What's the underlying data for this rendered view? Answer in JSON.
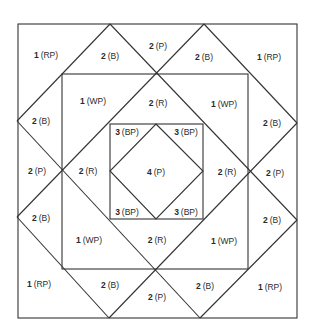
{
  "diagram": {
    "type": "quilt-block-piecing-diagram",
    "line_color": "#333333",
    "background": "#ffffff",
    "outer_square": {
      "x1": 18,
      "y1": 24,
      "x2": 297,
      "y2": 318
    },
    "middle_square": {
      "x1": 62,
      "y1": 74,
      "x2": 248,
      "y2": 269
    },
    "inner_square": {
      "x1": 110,
      "y1": 124,
      "x2": 203,
      "y2": 219
    },
    "inner_diamond": [
      [
        156,
        124
      ],
      [
        203,
        171
      ],
      [
        156,
        219
      ],
      [
        110,
        171
      ]
    ],
    "diagonals": [
      [
        [
          17,
          121
        ],
        [
          110,
          24
        ]
      ],
      [
        [
          110,
          24
        ],
        [
          297,
          220
        ]
      ],
      [
        [
          204,
          24
        ],
        [
          17,
          217
        ]
      ],
      [
        [
          204,
          24
        ],
        [
          297,
          123
        ]
      ],
      [
        [
          17,
          121
        ],
        [
          200,
          318
        ]
      ],
      [
        [
          297,
          123
        ],
        [
          109,
          318
        ]
      ],
      [
        [
          17,
          217
        ],
        [
          109,
          318
        ]
      ],
      [
        [
          297,
          220
        ],
        [
          200,
          318
        ]
      ]
    ],
    "labels": [
      {
        "num": "1",
        "code": "(RP)",
        "x": 46,
        "y": 55
      },
      {
        "num": "2",
        "code": "(B)",
        "x": 110,
        "y": 56
      },
      {
        "num": "2",
        "code": "(P)",
        "x": 158,
        "y": 46
      },
      {
        "num": "2",
        "code": "(B)",
        "x": 204,
        "y": 57
      },
      {
        "num": "1",
        "code": "(RP)",
        "x": 269,
        "y": 57
      },
      {
        "num": "1",
        "code": "(WP)",
        "x": 93,
        "y": 101
      },
      {
        "num": "2",
        "code": "(R)",
        "x": 158,
        "y": 103
      },
      {
        "num": "1",
        "code": "(WP)",
        "x": 224,
        "y": 104
      },
      {
        "num": "2",
        "code": "(B)",
        "x": 41,
        "y": 121
      },
      {
        "num": "2",
        "code": "(B)",
        "x": 272,
        "y": 123
      },
      {
        "num": "3",
        "code": "(BP)",
        "x": 127,
        "y": 132
      },
      {
        "num": "3",
        "code": "(BP)",
        "x": 186,
        "y": 132
      },
      {
        "num": "2",
        "code": "(P)",
        "x": 37,
        "y": 171
      },
      {
        "num": "2",
        "code": "(R)",
        "x": 88,
        "y": 171
      },
      {
        "num": "4",
        "code": "(P)",
        "x": 156,
        "y": 172
      },
      {
        "num": "2",
        "code": "(R)",
        "x": 227,
        "y": 172
      },
      {
        "num": "2",
        "code": "(P)",
        "x": 275,
        "y": 173
      },
      {
        "num": "3",
        "code": "(BP)",
        "x": 127,
        "y": 212
      },
      {
        "num": "3",
        "code": "(BP)",
        "x": 186,
        "y": 212
      },
      {
        "num": "2",
        "code": "(B)",
        "x": 41,
        "y": 218
      },
      {
        "num": "2",
        "code": "(B)",
        "x": 272,
        "y": 220
      },
      {
        "num": "1",
        "code": "(WP)",
        "x": 89,
        "y": 240
      },
      {
        "num": "2",
        "code": "(R)",
        "x": 157,
        "y": 240
      },
      {
        "num": "1",
        "code": "(WP)",
        "x": 224,
        "y": 241
      },
      {
        "num": "1",
        "code": "(RP)",
        "x": 39,
        "y": 284
      },
      {
        "num": "2",
        "code": "(B)",
        "x": 110,
        "y": 285
      },
      {
        "num": "2",
        "code": "(P)",
        "x": 157,
        "y": 297
      },
      {
        "num": "2",
        "code": "(B)",
        "x": 205,
        "y": 286
      },
      {
        "num": "1",
        "code": "(RP)",
        "x": 270,
        "y": 287
      }
    ]
  }
}
